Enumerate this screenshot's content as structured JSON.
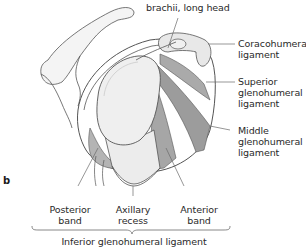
{
  "figure": {
    "panel_label": "b",
    "labels": {
      "biceps": "brachii, long head",
      "coracohumeral": [
        "Coracohumeral",
        "ligament"
      ],
      "superior": [
        "Superior",
        "glenohumeral",
        "ligament"
      ],
      "middle": [
        "Middle",
        "glenohumeral",
        "ligament"
      ],
      "posterior_band": [
        "Posterior",
        "band"
      ],
      "axillary_recess": [
        "Axillary",
        "recess"
      ],
      "anterior_band": [
        "Anterior",
        "band"
      ],
      "inferior": "Inferior glenohumeral ligament"
    },
    "colors": {
      "outline": "#555555",
      "ligament_fill": "#a9a9a9",
      "bone_fill": "#f2f2f2",
      "glenoid_fill": "#ebebeb",
      "leader_line": "#6a6a6a"
    }
  }
}
